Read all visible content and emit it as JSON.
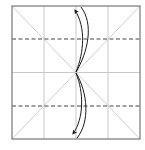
{
  "diagram": {
    "type": "origami-fold-diagram",
    "colors": {
      "background": "#ffffff",
      "border": "#777777",
      "crease": "#c8c8c8",
      "valley_fold": "#444444",
      "arrow": "#1a1a1a"
    },
    "square": {
      "x": 12,
      "y": 6,
      "size": 128
    },
    "grid": {
      "divisions": 4,
      "diagonals": true
    },
    "valley_folds": [
      {
        "name": "upper-valley-fold",
        "y_fraction": 0.25
      },
      {
        "name": "lower-valley-fold",
        "y_fraction": 0.75
      }
    ],
    "arrows": [
      {
        "name": "fold-unfold-arrow-top",
        "direction": "up",
        "from": "center",
        "to": "top-edge"
      },
      {
        "name": "fold-unfold-arrow-bottom",
        "direction": "down",
        "from": "center",
        "to": "bottom-edge"
      }
    ],
    "caption": "Fold top and bottom edges to the center and unfold"
  }
}
